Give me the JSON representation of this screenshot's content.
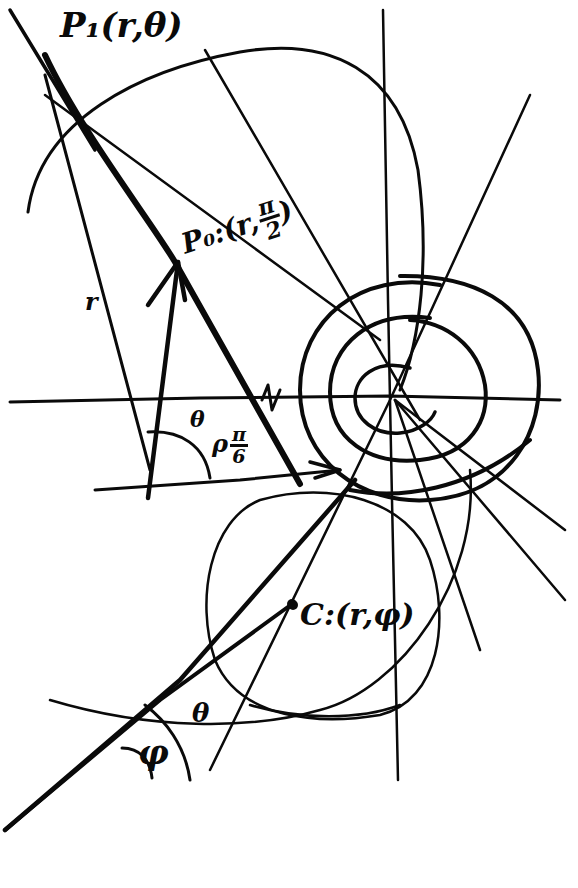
{
  "diagram": {
    "ink_color": "#0a0a0a",
    "background_color": "#ffffff",
    "labels": {
      "p1": {
        "text": "P₁(r,θ)"
      },
      "p0": {
        "prefix": "P₀:(r,",
        "num": "π",
        "den": "2",
        "suffix": ")"
      },
      "c": {
        "text": "C:(r,φ)"
      },
      "r": {
        "text": "r"
      },
      "theta_upper": {
        "text": "θ"
      },
      "angle_pi6": {
        "prefix": "ρ",
        "num": "π",
        "den": "6"
      },
      "theta_lower": {
        "text": "θ"
      },
      "phi": {
        "text": "φ"
      }
    }
  }
}
